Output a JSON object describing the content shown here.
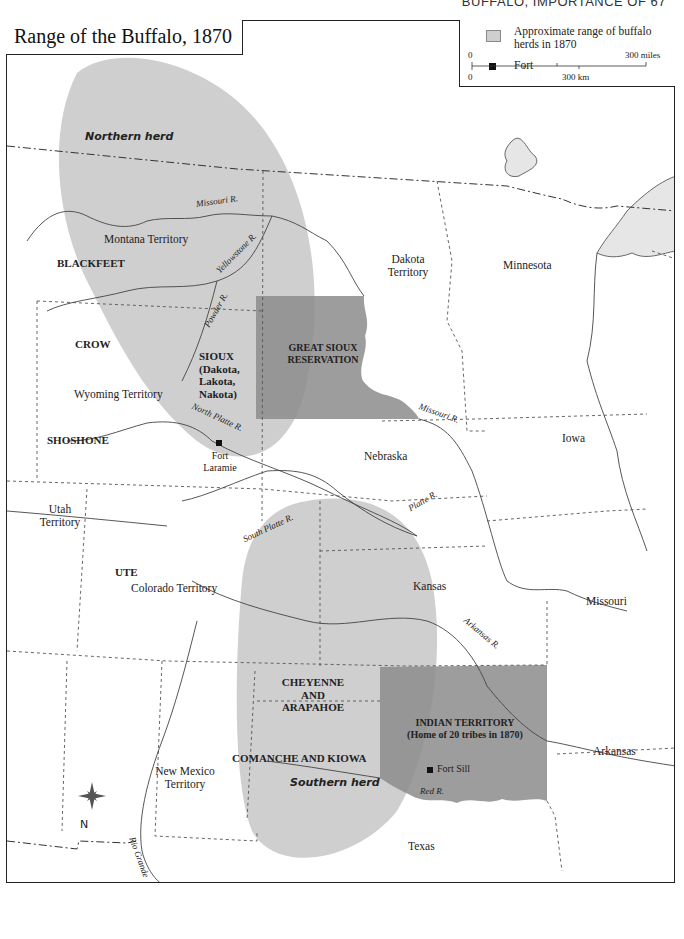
{
  "page_header": "BUFFALO, IMPORTANCE OF   67",
  "title": "Range of the Buffalo, 1870",
  "legend": {
    "range_label": "Approximate range of buffalo herds in 1870",
    "fort_label": "Fort",
    "scale": {
      "miles_start": "0",
      "miles_end": "300 miles",
      "km_start": "0",
      "km_end": "300 km"
    }
  },
  "colors": {
    "herd_range": "#cfcfcf",
    "reservation": "#8c8c8c",
    "lake": "#e6e6e6",
    "border": "#222222"
  },
  "herds": {
    "northern": "Northern herd",
    "southern": "Southern herd"
  },
  "territories": {
    "montana": "Montana Territory",
    "dakota_1": "Dakota",
    "dakota_2": "Territory",
    "minnesota": "Minnesota",
    "wyoming": "Wyoming Territory",
    "iowa": "Iowa",
    "nebraska": "Nebraska",
    "utah_1": "Utah",
    "utah_2": "Territory",
    "colorado": "Colorado Territory",
    "kansas": "Kansas",
    "missouri": "Missouri",
    "arkansas": "Arkansas",
    "new_mexico_1": "New Mexico",
    "new_mexico_2": "Territory",
    "texas": "Texas"
  },
  "tribes": {
    "blackfeet": "BLACKFEET",
    "crow": "CROW",
    "shoshone": "SHOSHONE",
    "sioux_1": "SIOUX",
    "sioux_2": "(Dakota,",
    "sioux_3": "Lakota,",
    "sioux_4": "Nakota)",
    "ute": "UTE",
    "cheyenne_1": "CHEYENNE",
    "cheyenne_2": "AND",
    "cheyenne_3": "ARAPAHOE",
    "comanche": "COMANCHE AND KIOWA"
  },
  "reservations": {
    "great_sioux_1": "GREAT SIOUX",
    "great_sioux_2": "RESERVATION",
    "indian_territory_1": "INDIAN TERRITORY",
    "indian_territory_2": "(Home of 20 tribes in 1870)"
  },
  "rivers": {
    "missouri_upper": "Missouri R.",
    "yellowstone": "Yellowstone R.",
    "powder": "Powder R.",
    "north_platte": "North Platte R.",
    "missouri_lower": "Missouri R.",
    "south_platte": "South Platte R.",
    "platte": "Platte R.",
    "arkansas": "Arkansas R.",
    "red": "Red R.",
    "rio_grande": "Rio Grande"
  },
  "forts": {
    "laramie_1": "Fort",
    "laramie_2": "Laramie",
    "sill": "Fort Sill"
  },
  "compass": {
    "north_label": "N"
  }
}
